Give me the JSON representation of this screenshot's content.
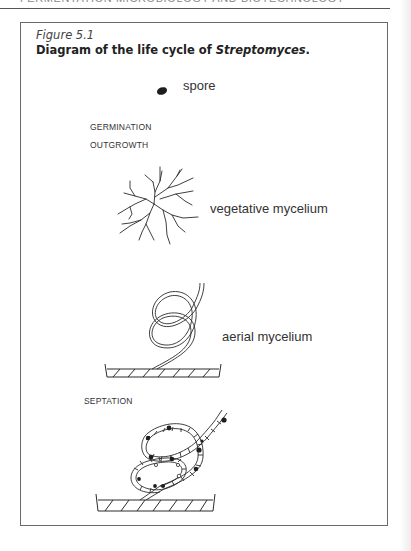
{
  "page": {
    "running_head": "FERMENTATION MICROBIOLOGY AND BIOTECHNOLOGY"
  },
  "figure": {
    "number": "Figure 5.1",
    "title_prefix": "Diagram of the life cycle of ",
    "title_organism": "Streptomyces",
    "title_suffix": ".",
    "stages": [
      {
        "id": "spore",
        "label": "spore",
        "type": "structure"
      },
      {
        "id": "germination",
        "label": "GERMINATION",
        "type": "process"
      },
      {
        "id": "outgrowth",
        "label": "OUTGROWTH",
        "type": "process"
      },
      {
        "id": "vegetative",
        "label": "vegetative mycelium",
        "type": "structure"
      },
      {
        "id": "aerial",
        "label": "aerial mycelium",
        "type": "structure"
      },
      {
        "id": "septation",
        "label": "SEPTATION",
        "type": "process"
      }
    ]
  },
  "colors": {
    "ink": "#2a2a2a",
    "frame": "#6a6a6a",
    "caption_gray": "#444444"
  }
}
